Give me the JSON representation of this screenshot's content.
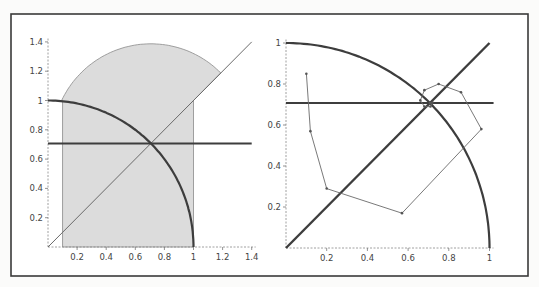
{
  "colors": {
    "background": "#fbfbfa",
    "frame": "#3a3a3a",
    "axis": "#888888",
    "curve": "#3d3d3d",
    "shade": "#dcdcdc",
    "path": "#6a6a6a"
  },
  "chart_data": [
    {
      "type": "line",
      "title": "",
      "xlabel": "",
      "ylabel": "",
      "xlim": [
        0,
        1.4
      ],
      "ylim": [
        0,
        1.4
      ],
      "grid": false,
      "x_ticks": [
        "0.2",
        "0.4",
        "0.6",
        "0.8",
        "1",
        "1.2",
        "1.4"
      ],
      "y_ticks": [
        "0.2",
        "0.4",
        "0.6",
        "0.8",
        "1",
        "1.2",
        "1.4"
      ],
      "series": [
        {
          "name": "unit quarter circle",
          "style": "thick",
          "equation": "x^2 + y^2 = 1, x in [0,1]"
        },
        {
          "name": "horizontal line",
          "style": "thick",
          "y": 0.707,
          "x_range": [
            0,
            1.4
          ]
        },
        {
          "name": "diagonal y = x",
          "style": "thin",
          "x_range": [
            0,
            1.4
          ]
        },
        {
          "name": "shaded region",
          "style": "filled",
          "description": "region x in [0.1, 1], bounded above by arc of circle centered (0.707, 0.707) radius ~0.68 (peak ~1.38) and by y = x",
          "vertices_hint": [
            [
              0.1,
              0.1
            ],
            [
              0.1,
              1.0
            ],
            [
              0.707,
              1.38
            ],
            [
              1.18,
              1.18
            ],
            [
              1.0,
              1.0
            ],
            [
              1.0,
              0.0
            ]
          ]
        }
      ]
    },
    {
      "type": "line",
      "title": "",
      "xlabel": "",
      "ylabel": "",
      "xlim": [
        0,
        1
      ],
      "ylim": [
        0,
        1
      ],
      "grid": false,
      "x_ticks": [
        "0.2",
        "0.4",
        "0.6",
        "0.8",
        "1"
      ],
      "y_ticks": [
        "0.2",
        "0.4",
        "0.6",
        "0.8",
        "1"
      ],
      "series": [
        {
          "name": "unit quarter circle",
          "style": "thick",
          "equation": "x^2 + y^2 = 1, x in [0,1]"
        },
        {
          "name": "horizontal line",
          "style": "thick",
          "y": 0.707,
          "x_range": [
            0,
            1.02
          ]
        },
        {
          "name": "diagonal y = x",
          "style": "thick",
          "x_range": [
            0,
            1.0
          ]
        },
        {
          "name": "iteration path",
          "style": "thin-with-markers",
          "points": [
            [
              0.1,
              0.85
            ],
            [
              0.12,
              0.57
            ],
            [
              0.2,
              0.29
            ],
            [
              0.57,
              0.17
            ],
            [
              0.96,
              0.58
            ],
            [
              0.86,
              0.76
            ],
            [
              0.75,
              0.8
            ],
            [
              0.68,
              0.77
            ],
            [
              0.66,
              0.72
            ],
            [
              0.68,
              0.69
            ],
            [
              0.71,
              0.69
            ],
            [
              0.72,
              0.71
            ],
            [
              0.707,
              0.707
            ]
          ]
        }
      ]
    }
  ]
}
